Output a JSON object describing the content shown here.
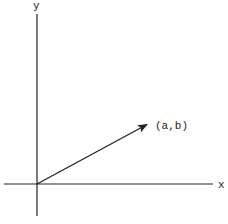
{
  "diagram": {
    "title": "",
    "axes": {
      "x_label": "x",
      "y_label": "y",
      "origin": [
        37,
        184
      ],
      "x_axis": {
        "from": [
          4,
          184
        ],
        "to": [
          213,
          184
        ]
      },
      "y_axis": {
        "from": [
          37,
          14
        ],
        "to": [
          37,
          216
        ]
      }
    },
    "vector": {
      "label": "(a,b)",
      "from": [
        37,
        184
      ],
      "to": [
        148,
        124
      ],
      "has_arrowhead": true
    },
    "colors": {
      "line": "#222222",
      "background": "#ffffff"
    }
  }
}
